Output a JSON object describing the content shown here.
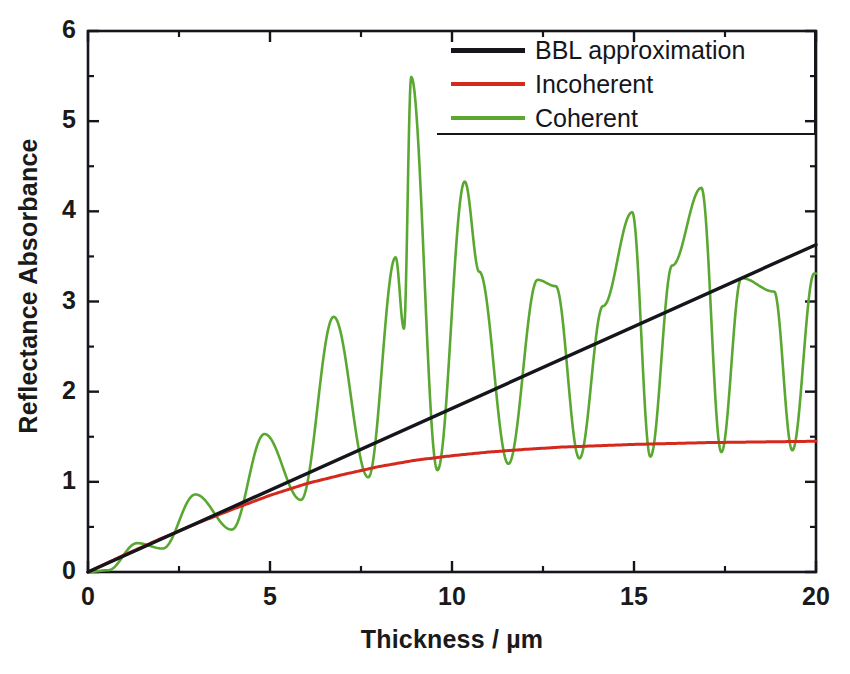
{
  "chart_data": {
    "type": "line",
    "title": "",
    "xlabel": "Thickness / µm",
    "ylabel": "Reflectance Absorbance",
    "xlim": [
      0,
      20
    ],
    "ylim": [
      0,
      6
    ],
    "xticks": [
      0,
      5,
      10,
      15,
      20
    ],
    "yticks": [
      0,
      1,
      2,
      3,
      4,
      5,
      6
    ],
    "xtick_labels": [
      "0",
      "5",
      "10",
      "15",
      "20"
    ],
    "ytick_labels": [
      "0",
      "1",
      "2",
      "3",
      "4",
      "5",
      "6"
    ],
    "minor_tick_step_x": 2.5,
    "minor_tick_step_y": 0.5,
    "grid": false,
    "legend_position": "top-right",
    "frame": "box",
    "colors": {
      "bbl": "#15161c",
      "incoherent": "#d42a1e",
      "coherent": "#5aa832",
      "axis": "#15161c",
      "background": "#ffffff"
    },
    "series": [
      {
        "name": "BBL approximation",
        "color": "#15161c",
        "description": "Straight line through origin, linear in thickness",
        "x": [
          0,
          2,
          4,
          6,
          8,
          10,
          12,
          14,
          16,
          18,
          20
        ],
        "values": [
          0.0,
          0.363,
          0.726,
          1.089,
          1.452,
          1.815,
          2.178,
          2.541,
          2.904,
          3.267,
          3.63
        ]
      },
      {
        "name": "Incoherent",
        "color": "#d42a1e",
        "description": "Rises from origin then saturates near 1.45",
        "x": [
          0,
          1,
          2,
          3,
          4,
          5,
          6,
          7,
          8,
          9,
          10,
          11,
          12,
          13,
          14,
          15,
          16,
          17,
          18,
          19,
          20
        ],
        "values": [
          0.0,
          0.19,
          0.37,
          0.54,
          0.7,
          0.85,
          0.98,
          1.08,
          1.17,
          1.24,
          1.29,
          1.33,
          1.36,
          1.385,
          1.4,
          1.415,
          1.425,
          1.435,
          1.44,
          1.445,
          1.45
        ]
      },
      {
        "name": "Coherent",
        "color": "#5aa832",
        "description": "Interference fringes oscillating about the incoherent baseline with sharp resonance peaks",
        "baseline_min": 0.96,
        "peaks": [
          {
            "x": 1.35,
            "y": 0.32
          },
          {
            "x": 2.95,
            "y": 0.86
          },
          {
            "x": 4.85,
            "y": 1.53
          },
          {
            "x": 6.75,
            "y": 2.83
          },
          {
            "x": 8.45,
            "y": 3.49
          },
          {
            "x": 8.68,
            "y": 2.7
          },
          {
            "x": 8.88,
            "y": 5.49
          },
          {
            "x": 10.35,
            "y": 4.33
          },
          {
            "x": 10.75,
            "y": 3.33
          },
          {
            "x": 12.35,
            "y": 3.24
          },
          {
            "x": 12.85,
            "y": 3.17
          },
          {
            "x": 14.15,
            "y": 2.95
          },
          {
            "x": 14.95,
            "y": 3.99
          },
          {
            "x": 16.05,
            "y": 3.4
          },
          {
            "x": 16.85,
            "y": 4.26
          },
          {
            "x": 17.95,
            "y": 3.26
          },
          {
            "x": 18.85,
            "y": 3.11
          },
          {
            "x": 19.95,
            "y": 3.31
          }
        ],
        "troughs": [
          {
            "x": 0.55,
            "y": 0.02
          },
          {
            "x": 2.05,
            "y": 0.26
          },
          {
            "x": 3.95,
            "y": 0.47
          },
          {
            "x": 5.85,
            "y": 0.8
          },
          {
            "x": 7.7,
            "y": 1.05
          },
          {
            "x": 9.6,
            "y": 1.13
          },
          {
            "x": 11.55,
            "y": 1.2
          },
          {
            "x": 13.5,
            "y": 1.26
          },
          {
            "x": 15.45,
            "y": 1.28
          },
          {
            "x": 17.4,
            "y": 1.33
          },
          {
            "x": 19.35,
            "y": 1.35
          }
        ]
      }
    ]
  },
  "legend": {
    "items": [
      {
        "label": "BBL approximation",
        "color": "#15161c"
      },
      {
        "label": "Incoherent",
        "color": "#d42a1e"
      },
      {
        "label": "Coherent",
        "color": "#5aa832"
      }
    ]
  }
}
